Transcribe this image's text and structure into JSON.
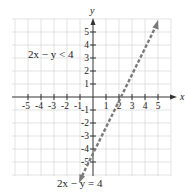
{
  "graph": {
    "axis_labels": {
      "x": "x",
      "y": "y"
    },
    "x_ticks": [
      "-5",
      "-4",
      "-3",
      "-2",
      "-1",
      "1",
      "2",
      "3",
      "4",
      "5"
    ],
    "y_ticks": [
      "5",
      "4",
      "3",
      "2",
      "1",
      "-1",
      "-2",
      "-3",
      "-4",
      "-5"
    ],
    "inequality_label": "2x − y < 4",
    "boundary_label": "2x − y = 4",
    "boundary_style": "dashed",
    "line_color": "#7a7a7a",
    "grid_color": "#d8d8d8"
  }
}
